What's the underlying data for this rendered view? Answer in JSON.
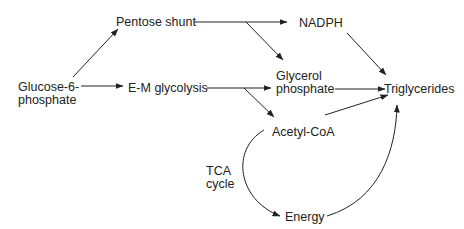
{
  "diagram": {
    "type": "metabolic-pathway-flow",
    "nodes": {
      "glucose6p_line1": "Glucose-6-",
      "glucose6p_line2": "phosphate",
      "pentose_shunt": "Pentose shunt",
      "nadph": "NADPH",
      "em_glycolysis": "E-M glycolysis",
      "glycerol_p_line1": "Glycerol",
      "glycerol_p_line2": "phosphate",
      "triglycerides": "Triglycerides",
      "acetyl_coa": "Acetyl-CoA",
      "energy": "Energy",
      "tca_line1": "TCA",
      "tca_line2": "cycle"
    },
    "edges": [
      {
        "from": "Glucose-6-phosphate",
        "to": "Pentose shunt"
      },
      {
        "from": "Glucose-6-phosphate",
        "to": "E-M glycolysis"
      },
      {
        "from": "Pentose shunt",
        "to": "NADPH"
      },
      {
        "from": "Pentose shunt",
        "to": "Glycerol phosphate"
      },
      {
        "from": "E-M glycolysis",
        "to": "Glycerol phosphate"
      },
      {
        "from": "E-M glycolysis",
        "to": "Acetyl-CoA"
      },
      {
        "from": "NADPH",
        "to": "Triglycerides"
      },
      {
        "from": "Glycerol phosphate",
        "to": "Triglycerides"
      },
      {
        "from": "Acetyl-CoA",
        "to": "Triglycerides"
      },
      {
        "from": "Acetyl-CoA",
        "to": "Energy",
        "label": "TCA cycle"
      },
      {
        "from": "Energy",
        "to": "Triglycerides"
      }
    ],
    "colors": {
      "line": "#222222",
      "text": "#222222",
      "background": "#ffffff"
    }
  }
}
